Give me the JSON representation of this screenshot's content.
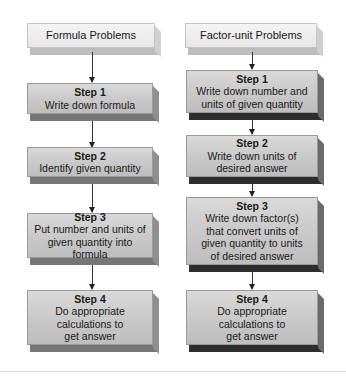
{
  "left_column": {
    "header": "Formula Problems",
    "steps": [
      {
        "title": "Step 1",
        "lines": [
          "Write down formula"
        ]
      },
      {
        "title": "Step 2",
        "lines": [
          "Identify given quantity"
        ]
      },
      {
        "title": "Step 3",
        "lines": [
          "Put number and units of",
          "given quantity into formula"
        ]
      },
      {
        "title": "Step 4",
        "lines": [
          "Do appropriate",
          "calculations to",
          "get answer"
        ]
      }
    ]
  },
  "right_column": {
    "header": "Factor-unit Problems",
    "steps": [
      {
        "title": "Step 1",
        "lines": [
          "Write down number and",
          "units of given quantity"
        ]
      },
      {
        "title": "Step 2",
        "lines": [
          "Write down units of",
          "desired answer"
        ]
      },
      {
        "title": "Step 3",
        "lines": [
          "Write down factor(s)",
          "that convert units of",
          "given quantity to units",
          "of desired answer"
        ]
      },
      {
        "title": "Step 4",
        "lines": [
          "Do appropriate",
          "calculations to",
          "get answer"
        ]
      }
    ]
  }
}
